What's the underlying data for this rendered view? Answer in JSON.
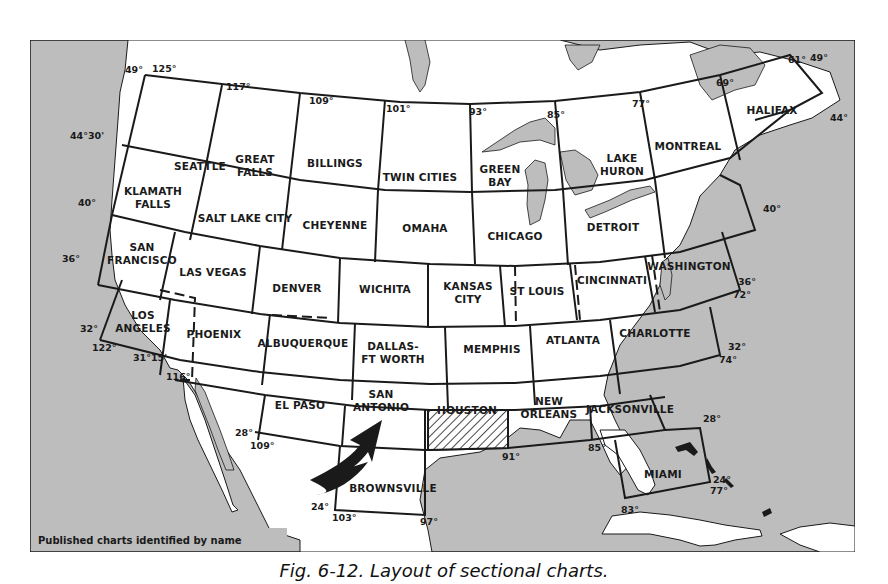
{
  "figure": {
    "caption": "Fig. 6-12. Layout of sectional charts.",
    "legend": "Published charts identified by name",
    "highlighted_chart": "HOUSTON",
    "colors": {
      "water": "#bdbdbd",
      "land": "#ffffff",
      "line": "#1a1a1a"
    }
  },
  "charts": [
    {
      "name_lines": [
        "SEATTLE"
      ],
      "x": 200,
      "y": 170
    },
    {
      "name_lines": [
        "GREAT",
        "FALLS"
      ],
      "x": 255,
      "y": 163
    },
    {
      "name_lines": [
        "BILLINGS"
      ],
      "x": 335,
      "y": 167
    },
    {
      "name_lines": [
        "TWIN CITIES"
      ],
      "x": 420,
      "y": 181
    },
    {
      "name_lines": [
        "GREEN",
        "BAY"
      ],
      "x": 500,
      "y": 173
    },
    {
      "name_lines": [
        "LAKE",
        "HURON"
      ],
      "x": 622,
      "y": 162
    },
    {
      "name_lines": [
        "MONTREAL"
      ],
      "x": 688,
      "y": 150
    },
    {
      "name_lines": [
        "HALIFAX"
      ],
      "x": 772,
      "y": 114
    },
    {
      "name_lines": [
        "KLAMATH",
        "FALLS"
      ],
      "x": 153,
      "y": 195
    },
    {
      "name_lines": [
        "SALT LAKE CITY"
      ],
      "x": 245,
      "y": 222
    },
    {
      "name_lines": [
        "CHEYENNE"
      ],
      "x": 335,
      "y": 229
    },
    {
      "name_lines": [
        "OMAHA"
      ],
      "x": 425,
      "y": 232
    },
    {
      "name_lines": [
        "CHICAGO"
      ],
      "x": 515,
      "y": 240
    },
    {
      "name_lines": [
        "DETROIT"
      ],
      "x": 613,
      "y": 231
    },
    {
      "name_lines": [
        "SAN",
        "FRANCISCO"
      ],
      "x": 142,
      "y": 251
    },
    {
      "name_lines": [
        "LAS VEGAS"
      ],
      "x": 213,
      "y": 276
    },
    {
      "name_lines": [
        "DENVER"
      ],
      "x": 297,
      "y": 292
    },
    {
      "name_lines": [
        "WICHITA"
      ],
      "x": 385,
      "y": 293
    },
    {
      "name_lines": [
        "KANSAS",
        "CITY"
      ],
      "x": 468,
      "y": 290
    },
    {
      "name_lines": [
        "ST LOUIS"
      ],
      "x": 537,
      "y": 295
    },
    {
      "name_lines": [
        "CINCINNATI"
      ],
      "x": 612,
      "y": 284
    },
    {
      "name_lines": [
        "WASHINGTON"
      ],
      "x": 689,
      "y": 270
    },
    {
      "name_lines": [
        "LOS",
        "ANGELES"
      ],
      "x": 143,
      "y": 319
    },
    {
      "name_lines": [
        "PHOENIX"
      ],
      "x": 214,
      "y": 338
    },
    {
      "name_lines": [
        "ALBUQUERQUE"
      ],
      "x": 303,
      "y": 347
    },
    {
      "name_lines": [
        "DALLAS-",
        "FT WORTH"
      ],
      "x": 393,
      "y": 350
    },
    {
      "name_lines": [
        "MEMPHIS"
      ],
      "x": 492,
      "y": 353
    },
    {
      "name_lines": [
        "ATLANTA"
      ],
      "x": 573,
      "y": 344
    },
    {
      "name_lines": [
        "CHARLOTTE"
      ],
      "x": 655,
      "y": 337
    },
    {
      "name_lines": [
        "EL PASO"
      ],
      "x": 300,
      "y": 409
    },
    {
      "name_lines": [
        "SAN",
        "ANTONIO"
      ],
      "x": 381,
      "y": 398
    },
    {
      "name_lines": [
        "HOUSTON"
      ],
      "x": 467,
      "y": 414
    },
    {
      "name_lines": [
        "NEW",
        "ORLEANS"
      ],
      "x": 549,
      "y": 405
    },
    {
      "name_lines": [
        "JACKSONVILLE"
      ],
      "x": 630,
      "y": 413
    },
    {
      "name_lines": [
        "BROWNSVILLE"
      ],
      "x": 393,
      "y": 492
    },
    {
      "name_lines": [
        "MIAMI"
      ],
      "x": 663,
      "y": 478
    }
  ],
  "coordinates": [
    {
      "label": "125°",
      "x": 152,
      "y": 72
    },
    {
      "label": "49°",
      "x": 125,
      "y": 73
    },
    {
      "label": "117°",
      "x": 226,
      "y": 90
    },
    {
      "label": "109°",
      "x": 309,
      "y": 104
    },
    {
      "label": "101°",
      "x": 386,
      "y": 112
    },
    {
      "label": "93°",
      "x": 469,
      "y": 115
    },
    {
      "label": "85°",
      "x": 547,
      "y": 118
    },
    {
      "label": "77°",
      "x": 632,
      "y": 107
    },
    {
      "label": "69°",
      "x": 716,
      "y": 86
    },
    {
      "label": "61°",
      "x": 788,
      "y": 63
    },
    {
      "label": "49°",
      "x": 810,
      "y": 61
    },
    {
      "label": "44°",
      "x": 830,
      "y": 121
    },
    {
      "label": "44°30'",
      "x": 70,
      "y": 139
    },
    {
      "label": "40°",
      "x": 78,
      "y": 206
    },
    {
      "label": "40°",
      "x": 763,
      "y": 212
    },
    {
      "label": "36°",
      "x": 62,
      "y": 262
    },
    {
      "label": "36°",
      "x": 738,
      "y": 285
    },
    {
      "label": "72°",
      "x": 733,
      "y": 298
    },
    {
      "label": "32°",
      "x": 80,
      "y": 332
    },
    {
      "label": "122°",
      "x": 92,
      "y": 351
    },
    {
      "label": "31°15'",
      "x": 133,
      "y": 361
    },
    {
      "label": "116°",
      "x": 166,
      "y": 380
    },
    {
      "label": "32°",
      "x": 728,
      "y": 350
    },
    {
      "label": "74°",
      "x": 719,
      "y": 363
    },
    {
      "label": "28°",
      "x": 235,
      "y": 436
    },
    {
      "label": "109°",
      "x": 250,
      "y": 449
    },
    {
      "label": "28°",
      "x": 703,
      "y": 422
    },
    {
      "label": "91°",
      "x": 502,
      "y": 460
    },
    {
      "label": "85°",
      "x": 588,
      "y": 451
    },
    {
      "label": "24°",
      "x": 311,
      "y": 510
    },
    {
      "label": "103°",
      "x": 332,
      "y": 521
    },
    {
      "label": "97°",
      "x": 420,
      "y": 525
    },
    {
      "label": "24°",
      "x": 713,
      "y": 483
    },
    {
      "label": "77°",
      "x": 710,
      "y": 494
    },
    {
      "label": "83°",
      "x": 621,
      "y": 513
    }
  ]
}
